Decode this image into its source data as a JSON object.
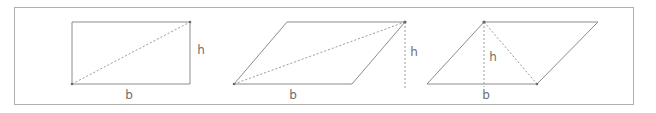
{
  "figure": {
    "frame": {
      "x": 14,
      "y": 7,
      "width": 620,
      "height": 98,
      "stroke": "#b0b0b0"
    },
    "colors": {
      "outline": "#8c8c8c",
      "dashed": "#9a9a9a",
      "label": "#6e6e6e",
      "frame": "#b0b0b0",
      "background": "#ffffff"
    },
    "shapes": [
      {
        "id": "rectangle",
        "name": "rectangle",
        "outline_points": "72,22 190,22 190,84 72,84",
        "diagonal": {
          "x1": 72,
          "y1": 84,
          "x2": 190,
          "y2": 22
        },
        "height_line": null,
        "labels": [
          {
            "id": "base",
            "text": "b",
            "x": 129,
            "y": 95
          },
          {
            "id": "height",
            "text": "h",
            "x": 201,
            "y": 50
          }
        ],
        "vertices": [
          {
            "x": 72,
            "y": 84
          },
          {
            "x": 190,
            "y": 22
          }
        ]
      },
      {
        "id": "parallelogram-right-lean",
        "name": "parallelogram",
        "outline_points": "234,84 287,22 405,22 352,84",
        "diagonal": {
          "x1": 234,
          "y1": 84,
          "x2": 405,
          "y2": 22
        },
        "height_line": {
          "x1": 405,
          "y1": 22,
          "x2": 405,
          "y2": 88
        },
        "labels": [
          {
            "id": "base",
            "text": "b",
            "x": 293,
            "y": 95
          },
          {
            "id": "height",
            "text": "h",
            "x": 414,
            "y": 52
          }
        ],
        "vertices": [
          {
            "x": 234,
            "y": 84
          },
          {
            "x": 405,
            "y": 22
          }
        ]
      },
      {
        "id": "parallelogram-obtuse",
        "name": "parallelogram",
        "outline_points": "427,84 484,22 598,22 537,84",
        "diagonal": {
          "x1": 484,
          "y1": 22,
          "x2": 537,
          "y2": 84
        },
        "height_line": {
          "x1": 484,
          "y1": 22,
          "x2": 484,
          "y2": 87
        },
        "labels": [
          {
            "id": "base",
            "text": "b",
            "x": 486,
            "y": 95
          },
          {
            "id": "height",
            "text": "h",
            "x": 493,
            "y": 57
          }
        ],
        "vertices": [
          {
            "x": 484,
            "y": 22
          },
          {
            "x": 537,
            "y": 84
          }
        ]
      }
    ]
  }
}
